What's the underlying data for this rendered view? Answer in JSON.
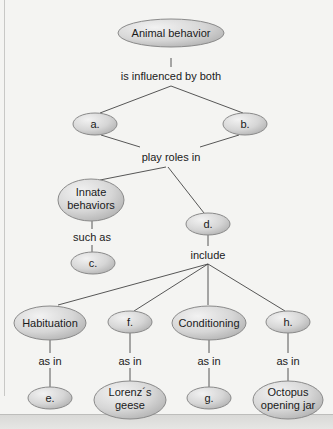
{
  "diagram": {
    "type": "concept-map",
    "colors": {
      "node_fill_light": "#efefef",
      "node_fill_dark": "#b8b8b8",
      "node_stroke": "#8a8a8a",
      "line": "#444444",
      "background": "#f4f4f2"
    },
    "nodes": {
      "root": "Animal behavior",
      "a": "a.",
      "b": "b.",
      "innate": [
        "Innate",
        "behaviors"
      ],
      "c": "c.",
      "d": "d.",
      "habituation": "Habituation",
      "f": "f.",
      "conditioning": "Conditioning",
      "h": "h.",
      "e": "e.",
      "lorenz": [
        "Lorenz´s",
        "geese"
      ],
      "g": "g.",
      "octopus": [
        "Octopus",
        "opening jar"
      ]
    },
    "links": {
      "influenced": "is influenced by both",
      "play_roles": "play roles in",
      "such_as": "such as",
      "include": "include",
      "as_in_1": "as in",
      "as_in_2": "as in",
      "as_in_3": "as in",
      "as_in_4": "as in"
    },
    "edges": [
      [
        "root",
        "influenced"
      ],
      [
        "influenced",
        "a"
      ],
      [
        "influenced",
        "b"
      ],
      [
        "a",
        "play_roles"
      ],
      [
        "b",
        "play_roles"
      ],
      [
        "play_roles",
        "innate"
      ],
      [
        "play_roles",
        "d"
      ],
      [
        "innate",
        "such_as"
      ],
      [
        "such_as",
        "c"
      ],
      [
        "d",
        "include"
      ],
      [
        "include",
        "habituation"
      ],
      [
        "include",
        "f"
      ],
      [
        "include",
        "conditioning"
      ],
      [
        "include",
        "h"
      ],
      [
        "habituation",
        "as_in_1"
      ],
      [
        "as_in_1",
        "e"
      ],
      [
        "f",
        "as_in_2"
      ],
      [
        "as_in_2",
        "lorenz"
      ],
      [
        "conditioning",
        "as_in_3"
      ],
      [
        "as_in_3",
        "g"
      ],
      [
        "h",
        "as_in_4"
      ],
      [
        "as_in_4",
        "octopus"
      ]
    ]
  }
}
